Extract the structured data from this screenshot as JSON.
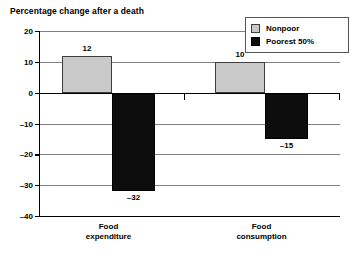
{
  "chart_data": {
    "type": "bar",
    "title": "Percentage change after a death",
    "xlabel": "",
    "ylabel": "",
    "ylim": [
      -40,
      20
    ],
    "yticks": [
      20,
      10,
      0,
      -10,
      -20,
      -30,
      -40
    ],
    "ytick_labels": [
      "20",
      "10",
      "0",
      "–10",
      "–20",
      "–30",
      "–40"
    ],
    "grid": true,
    "legend_position": "top-right",
    "categories": [
      "Food expenditure",
      "Food consumption"
    ],
    "category_lines": [
      [
        "Food",
        "expenditure"
      ],
      [
        "Food",
        "consumption"
      ]
    ],
    "series": [
      {
        "name": "Nonpoor",
        "color": "#c9c9c9",
        "values": [
          12,
          10
        ],
        "data_labels": [
          "12",
          "10"
        ]
      },
      {
        "name": "Poorest 50%",
        "color": "#0d0d0d",
        "values": [
          -32,
          -15
        ],
        "data_labels": [
          "–32",
          "–15"
        ]
      }
    ]
  },
  "legend": {
    "items": [
      {
        "label": "Nonpoor",
        "swatch": "nonpoor"
      },
      {
        "label": "Poorest 50%",
        "swatch": "poorest"
      }
    ]
  }
}
